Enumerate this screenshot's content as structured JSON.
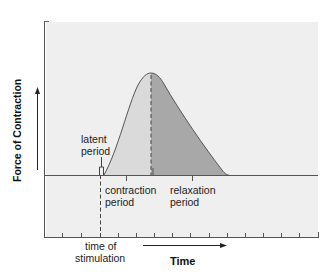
{
  "diagram": {
    "y_axis_label": "Force of Contraction",
    "x_axis_label": "Time",
    "annotations": {
      "latent": [
        "latent",
        "period"
      ],
      "contraction": [
        "contraction",
        "period"
      ],
      "relaxation": [
        "relaxation",
        "period"
      ],
      "stimulation": [
        "time of",
        "stimulation"
      ]
    },
    "colors": {
      "panel_background": "#efefef",
      "contraction_fill": "#dadada",
      "relaxation_fill": "#a8a8a8",
      "line": "#555555"
    },
    "geometry": {
      "baseline_y": 175,
      "stimulation_x": 100,
      "curve_start_x": 104,
      "peak": {
        "x": 151,
        "y": 73
      },
      "curve_end_x": 229,
      "bottom_axis_y": 237,
      "tick_count": 16
    }
  }
}
